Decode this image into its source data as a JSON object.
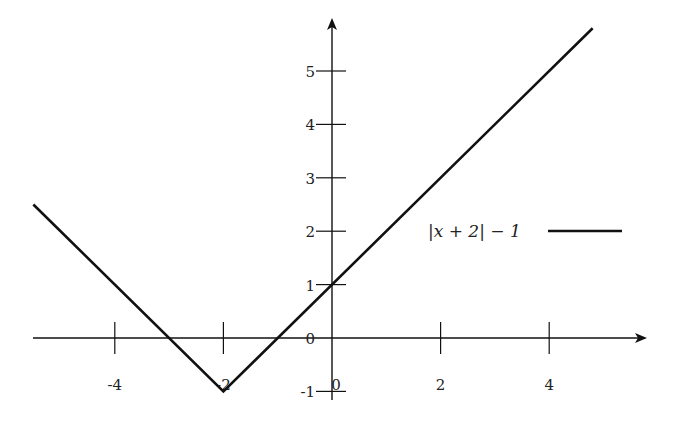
{
  "chart_data": {
    "type": "line",
    "title": "",
    "xlabel": "",
    "ylabel": "",
    "xlim": [
      -5.5,
      5.6
    ],
    "ylim": [
      -1.2,
      5.9
    ],
    "grid": false,
    "legend_position": "right",
    "x_ticks": [
      -4,
      -2,
      0,
      2,
      4
    ],
    "x_tick_labels": [
      "-4",
      "-2",
      "0",
      "2",
      "4"
    ],
    "y_ticks": [
      -1,
      0,
      1,
      2,
      3,
      4,
      5
    ],
    "y_tick_labels": [
      "-1",
      "0",
      "1",
      "2",
      "3",
      "4",
      "5"
    ],
    "series": [
      {
        "name": "|x + 2| − 1",
        "color": "#111111",
        "x": [
          -5.5,
          -2,
          4.8
        ],
        "y": [
          2.5,
          -1,
          5.8
        ]
      }
    ]
  },
  "legend": {
    "label": "|x + 2| − 1"
  }
}
